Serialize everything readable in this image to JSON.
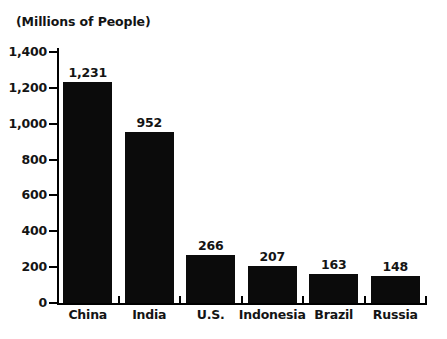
{
  "chart_data": {
    "type": "bar",
    "title": "",
    "subtitle": "",
    "unit_caption": "(Millions of People)",
    "categories": [
      "China",
      "India",
      "U.S.",
      "Indonesia",
      "Brazil",
      "Russia"
    ],
    "values": [
      1231,
      952,
      266,
      207,
      163,
      148
    ],
    "value_labels": [
      "1,231",
      "952",
      "266",
      "207",
      "163",
      "148"
    ],
    "xlabel": "",
    "ylabel": "",
    "ylim": [
      0,
      1400
    ],
    "y_ticks": [
      0,
      200,
      400,
      600,
      800,
      1000,
      1200,
      1400
    ],
    "y_tick_labels": [
      "0",
      "200",
      "400",
      "600",
      "800",
      "1,000",
      "1,200",
      "1,400"
    ],
    "grid": false,
    "legend": null,
    "bar_color": "#0b0b0b",
    "axis_color": "#000000",
    "text_color": "#141414",
    "background": "#ffffff"
  }
}
